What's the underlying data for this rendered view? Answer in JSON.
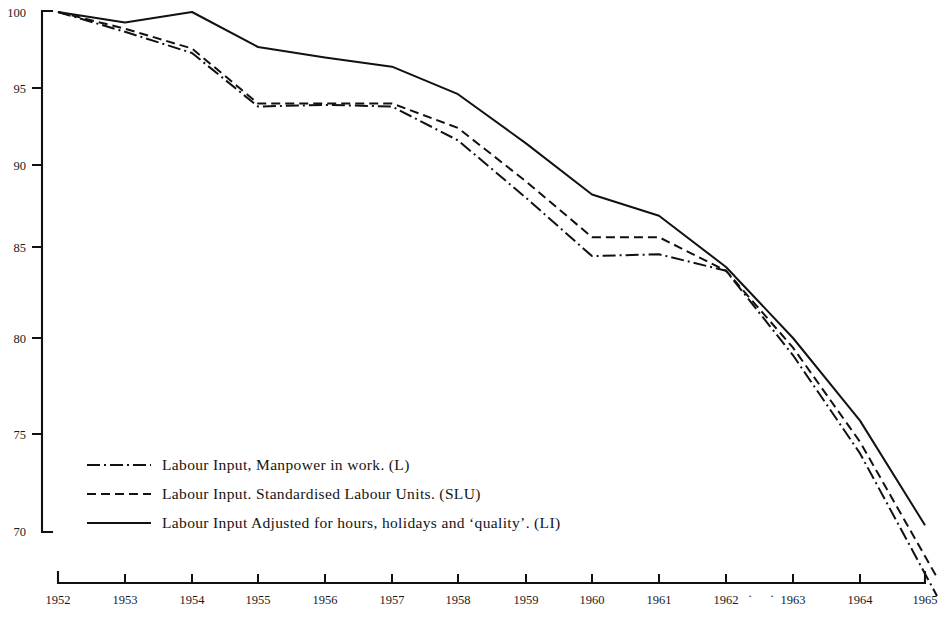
{
  "chart_data": {
    "type": "line",
    "title": "",
    "subtitle": "",
    "xlabel": "",
    "ylabel": "",
    "x": [
      1952,
      1953,
      1954,
      1955,
      1956,
      1957,
      1958,
      1959,
      1960,
      1961,
      1962,
      1963,
      1964,
      1965
    ],
    "xlim": [
      1952,
      1965
    ],
    "ylim": [
      70,
      100
    ],
    "ytick_labels": [
      "100",
      "95",
      "90",
      "85",
      "80",
      "75",
      "70"
    ],
    "ytick_values": [
      100,
      95,
      90,
      85,
      80,
      75,
      70
    ],
    "xtick_labels": [
      "1952",
      "1953",
      "1954",
      "1955",
      "1956",
      "1957",
      "1958",
      "1959",
      "1960",
      "1961",
      "1962",
      "1963",
      "1964",
      "1965"
    ],
    "grid": false,
    "legend_position": "lower-left-inside",
    "series": [
      {
        "name": "L",
        "label": "Labour Input, Manpower in work. (L)",
        "style": "dash-dot",
        "values": [
          100.0,
          98.7,
          97.3,
          93.8,
          93.9,
          93.8,
          91.6,
          88.0,
          84.5,
          84.6,
          83.7,
          79.1,
          74.0,
          67.8
        ]
      },
      {
        "name": "SLU",
        "label": "Labour Input. Standardised Labour Units. (SLU)",
        "style": "dashed",
        "values": [
          100.0,
          98.9,
          97.6,
          94.0,
          94.0,
          94.0,
          92.4,
          89.0,
          85.6,
          85.6,
          83.7,
          79.5,
          74.6,
          68.7
        ]
      },
      {
        "name": "LI",
        "label": "Labour Input Adjusted for hours, holidays and ‘quality’. (LI)",
        "style": "solid",
        "values": [
          100.0,
          99.3,
          100.0,
          97.7,
          97.0,
          96.4,
          94.6,
          91.4,
          88.2,
          86.9,
          83.9,
          80.0,
          75.7,
          70.3
        ]
      }
    ]
  },
  "axes": {
    "y_ticks_px": [
      {
        "label": "100",
        "y": 12
      },
      {
        "label": "95",
        "y": 88
      },
      {
        "label": "90",
        "y": 165
      },
      {
        "label": "85",
        "y": 247
      },
      {
        "label": "80",
        "y": 338
      },
      {
        "label": "75",
        "y": 434
      },
      {
        "label": "70",
        "y": 531
      }
    ],
    "x_ticks_px": [
      {
        "label": "1952",
        "x": 58
      },
      {
        "label": "1953",
        "x": 125
      },
      {
        "label": "1954",
        "x": 192
      },
      {
        "label": "1955",
        "x": 258
      },
      {
        "label": "1956",
        "x": 325
      },
      {
        "label": "1957",
        "x": 392
      },
      {
        "label": "1958",
        "x": 458
      },
      {
        "label": "1959",
        "x": 526
      },
      {
        "label": "1960",
        "x": 592
      },
      {
        "label": "1961",
        "x": 659
      },
      {
        "label": "1962",
        "x": 726
      },
      {
        "label": "1963",
        "x": 793
      },
      {
        "label": "1964",
        "x": 860
      },
      {
        "label": "1965",
        "x": 925
      }
    ],
    "marks": [
      {
        "name": "dot-after-1962",
        "char": "·",
        "x": 750,
        "y": 600
      },
      {
        "name": "dot-before-1963",
        "char": "·",
        "x": 772,
        "y": 600
      }
    ]
  },
  "legend": {
    "rows": [
      {
        "style": "dash-dot",
        "label": "Labour Input, Manpower in work. (L)"
      },
      {
        "style": "dashed",
        "label": "Labour Input. Standardised Labour Units. (SLU)"
      },
      {
        "style": "solid",
        "label": "Labour Input Adjusted for hours, holidays and ‘quality’. (LI)"
      }
    ]
  },
  "colors": {
    "ink": "#111111",
    "background": "#ffffff"
  }
}
